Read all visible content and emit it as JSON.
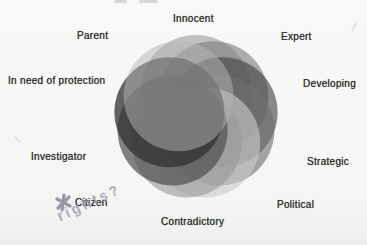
{
  "diagram": {
    "type": "overlapping-circles-flower",
    "description_labels_clockwise_from_top": true,
    "segments": [
      {
        "label": "Innocent",
        "color": "#9e9e9e",
        "opacity": 0.62
      },
      {
        "label": "Expert",
        "color": "#7e7e7e",
        "opacity": 0.62
      },
      {
        "label": "Developing",
        "color": "#424242",
        "opacity": 0.62
      },
      {
        "label": "Strategic",
        "color": "#6f6f6f",
        "opacity": 0.62
      },
      {
        "label": "Political",
        "color": "#c9c9c9",
        "opacity": 0.62
      },
      {
        "label": "Contradictory",
        "color": "#9a9a9a",
        "opacity": 0.62
      },
      {
        "label": "Investigator",
        "color": "#4f4f4f",
        "opacity": 0.7
      },
      {
        "label": "In need of protection",
        "color": "#303030",
        "opacity": 0.75
      },
      {
        "label": "Parent",
        "color": "#b5b5b5",
        "opacity": 0.5
      }
    ],
    "geometry": {
      "center_x": 196,
      "center_y": 117,
      "ring_radius": 27,
      "circle_radius": 55,
      "start_angle_deg": -90,
      "step_deg": 40
    },
    "annotations": {
      "citizen_label": "Citizen",
      "handwritten_note": "rights?",
      "handwritten_marker": "star-asterisk",
      "handwriting_color": "#a29ab0",
      "marker_color": "#8b8497"
    },
    "ink_color": "#2d2d2d",
    "paper_color": "#f7f7f6"
  }
}
